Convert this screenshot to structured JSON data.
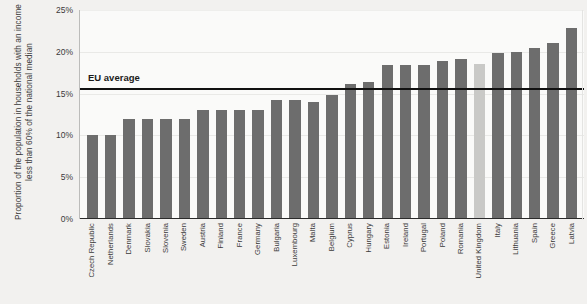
{
  "chart_data": {
    "type": "bar",
    "title": "",
    "xlabel": "",
    "ylabel": "Proportion of the population in households with an income less than 60% of the national median",
    "ylim": [
      0,
      25
    ],
    "ytick_labels": [
      "25%",
      "20%",
      "15%",
      "10%",
      "5%",
      "0%"
    ],
    "ytick_values": [
      25,
      20,
      15,
      10,
      5,
      0
    ],
    "grid": true,
    "legend": "none",
    "categories": [
      "Czech Republic",
      "Netherlands",
      "Denmark",
      "Slovakia",
      "Slovenia",
      "Sweden",
      "Austria",
      "Finland",
      "France",
      "Germany",
      "Bulgaria",
      "Luxembourg",
      "Malta",
      "Belgium",
      "Cyprus",
      "Hungary",
      "Estonia",
      "Ireland",
      "Portugal",
      "Poland",
      "Romania",
      "United Kingdom",
      "Italy",
      "Lithuania",
      "Spain",
      "Greece",
      "Latvia"
    ],
    "values": [
      10.0,
      10.0,
      12.0,
      12.0,
      12.0,
      12.0,
      13.0,
      13.0,
      13.0,
      13.0,
      14.2,
      14.2,
      14.0,
      14.8,
      16.2,
      16.4,
      18.4,
      18.4,
      18.4,
      18.9,
      19.2,
      18.6,
      19.9,
      20.0,
      20.4,
      21.0,
      22.9
    ],
    "highlighted_category": "United Kingdom",
    "bar_color": "#6d6d6d",
    "highlight_color": "#c9c9c7",
    "annotations": [
      {
        "label": "EU average",
        "value": 15.7,
        "line_color": "#111111"
      }
    ]
  },
  "axis": {
    "ytick_0": "25%",
    "ytick_1": "20%",
    "ytick_2": "15%",
    "ytick_3": "10%",
    "ytick_4": "5%",
    "ytick_5": "0%"
  },
  "annotation": {
    "eu_average_label": "EU average"
  }
}
